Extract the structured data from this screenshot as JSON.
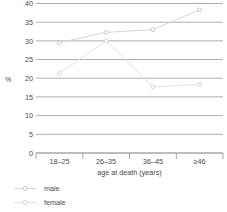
{
  "chart_data": {
    "type": "line",
    "title": "",
    "subtitle": "",
    "xlabel": "age at death (years)",
    "ylabel": "%",
    "categories": [
      "18–25",
      "26–35",
      "36–45",
      "≥46"
    ],
    "series": [
      {
        "name": "male",
        "values": [
          29.5,
          32.3,
          33.0,
          38.3
        ],
        "color": "#d9d9d9"
      },
      {
        "name": "female",
        "values": [
          21.3,
          30.0,
          17.7,
          18.3
        ],
        "color": "#e2e2e2"
      }
    ],
    "ylim": [
      0,
      40
    ],
    "yticks": [
      0,
      5,
      10,
      15,
      20,
      25,
      30,
      35,
      40
    ],
    "ytick_labels": [
      "0",
      "5",
      "10",
      "15",
      "20",
      "25",
      "30",
      "35",
      "40"
    ],
    "grid": true,
    "grid_axis": "y",
    "legend_position": "bottom-left",
    "annotations": []
  },
  "axes": {
    "y_axis_label": "%",
    "x_axis_label": "age at death (years)",
    "y_tick_0": "0",
    "y_tick_5": "5",
    "y_tick_10": "10",
    "y_tick_15": "15",
    "y_tick_20": "20",
    "y_tick_25": "25",
    "y_tick_30": "30",
    "y_tick_35": "35",
    "y_tick_40": "40",
    "x_tick_1": "18–25",
    "x_tick_2": "26–35",
    "x_tick_3": "36–45",
    "x_tick_4": "≥46"
  },
  "legend": {
    "items": [
      {
        "label": "male",
        "color": "#d9d9d9"
      },
      {
        "label": "female",
        "color": "#e2e2e2"
      }
    ]
  },
  "colors": {
    "gridline": "#9a9a9a",
    "axis": "#7d7d7d",
    "text": "#4a4a4a",
    "background": "#ffffff"
  }
}
